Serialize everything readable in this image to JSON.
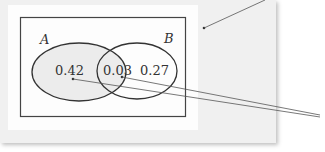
{
  "diagram": {
    "type": "venn",
    "sets": [
      {
        "name": "A",
        "label": "A"
      },
      {
        "name": "B",
        "label": "B"
      }
    ],
    "regions": {
      "a_only": "0.42",
      "a_and_b": "0.03",
      "b_only": "0.27"
    }
  },
  "colors": {
    "background": "#f0f0f0",
    "paper": "#fdfdfd",
    "stroke": "#333333",
    "fill_a": "#ececec"
  }
}
